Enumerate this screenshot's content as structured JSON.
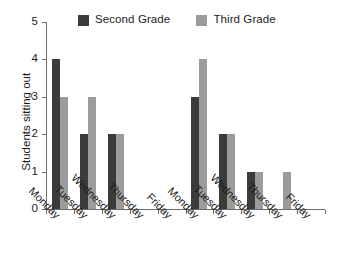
{
  "chart_data": {
    "type": "bar",
    "title": "",
    "subtitle": "",
    "xlabel": "",
    "ylabel": "Students sitting out",
    "ylim": [
      0,
      5
    ],
    "yticks": [
      0,
      1,
      2,
      3,
      4,
      5
    ],
    "grid": false,
    "legend_position": "top",
    "categories": [
      "Monday",
      "Tuesday",
      "Wednesday",
      "Thursday",
      "Friday",
      "Monday",
      "Tuesday",
      "Wednesday",
      "Thursday",
      "Friday"
    ],
    "series": [
      {
        "name": "Second Grade",
        "color": "#3b3b3b",
        "values": [
          4,
          2,
          2,
          0,
          0,
          3,
          2,
          1,
          0,
          0
        ]
      },
      {
        "name": "Third Grade",
        "color": "#9c9c9c",
        "values": [
          3,
          3,
          2,
          0,
          0,
          4,
          2,
          1,
          1,
          0
        ]
      }
    ]
  },
  "legend": {
    "entries": [
      {
        "label": "Second Grade",
        "color": "#3b3b3b"
      },
      {
        "label": "Third Grade",
        "color": "#9c9c9c"
      }
    ]
  },
  "axes": {
    "y_title": "Students sitting out",
    "y_ticks": [
      "0",
      "1",
      "2",
      "3",
      "4",
      "5"
    ],
    "x_ticks": [
      "Monday",
      "Tuesday",
      "Wednesday",
      "Thursday",
      "Friday",
      "Monday",
      "Tuesday",
      "Wednesday",
      "Thursday",
      "Friday"
    ]
  },
  "style": {
    "axis_color": "#6d6d6d",
    "text_color": "#1c1c1c",
    "background": "#ffffff"
  }
}
